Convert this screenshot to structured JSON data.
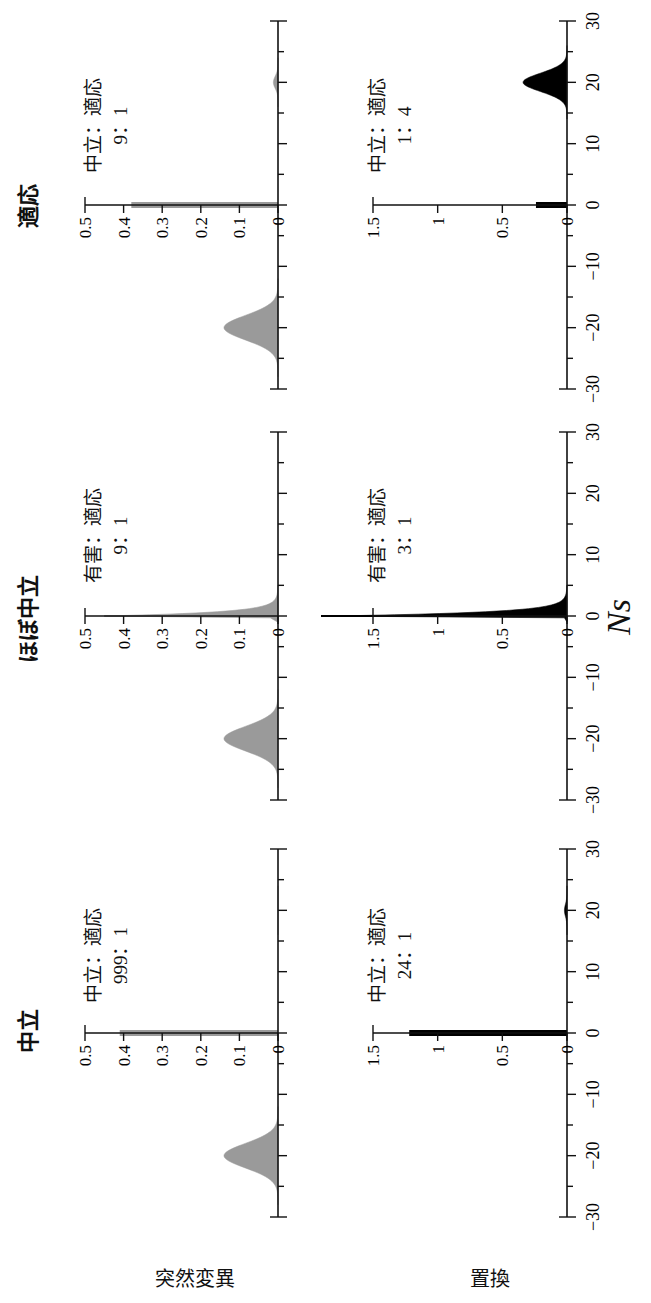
{
  "figure": {
    "orientation": "rotated 90 degrees counterclockwise",
    "x_axis_label": "Ns",
    "columns": [
      "中立",
      "ほぼ中立",
      "適応"
    ],
    "rows": [
      "突然変異",
      "置換"
    ],
    "x_ticks": [
      "−30",
      "−20",
      "−10",
      "0",
      "10",
      "20",
      "30"
    ],
    "row_y_ticks": {
      "突然変異": [
        "0",
        "0.1",
        "0.2",
        "0.3",
        "0.4",
        "0.5"
      ],
      "置換": [
        "0",
        "0.5",
        "1",
        "1.5"
      ]
    },
    "annotations": {
      "neutral_mut_1": "中立：適応",
      "neutral_mut_2": "999：1",
      "neutral_sub_1": "中立：適応",
      "neutral_sub_2": "24：1",
      "nearly_mut_1": "有害：適応",
      "nearly_mut_2": "9：1",
      "nearly_sub_1": "有害：適応",
      "nearly_sub_2": "3：1",
      "adaptive_mut_1": "中立：適応",
      "adaptive_mut_2": "9：1",
      "adaptive_sub_1": "中立：適応",
      "adaptive_sub_2": "1：4"
    }
  },
  "chart_data": [
    {
      "type": "area",
      "title": "中立 — 突然変異",
      "xlabel": "Ns",
      "ylabel": "突然変異",
      "xlim": [
        -30,
        30
      ],
      "ylim": [
        0,
        0.5
      ],
      "annotation": "中立：適応 999：1",
      "series": [
        {
          "name": "deleterious (Ns≈−20)",
          "shape": "gaussian",
          "center": -20,
          "sd": 2,
          "peak": 0.14
        },
        {
          "name": "neutral spike (Ns=0)",
          "shape": "spike",
          "x": 0,
          "value": 0.41
        },
        {
          "name": "adaptive (Ns≈20)",
          "shape": "gaussian",
          "center": 20,
          "sd": 1,
          "peak": 0.0
        }
      ],
      "color": "#9a9a9a"
    },
    {
      "type": "area",
      "title": "中立 — 置換",
      "xlabel": "Ns",
      "ylabel": "置換",
      "xlim": [
        -30,
        30
      ],
      "ylim": [
        0,
        1.5
      ],
      "annotation": "中立：適応 24：1",
      "series": [
        {
          "name": "neutral spike (Ns=0)",
          "shape": "spike",
          "x": 0,
          "value": 1.22
        },
        {
          "name": "adaptive (Ns≈20)",
          "shape": "gaussian",
          "center": 20,
          "sd": 1,
          "peak": 0.02
        }
      ],
      "color": "#000000"
    },
    {
      "type": "area",
      "title": "ほぼ中立 — 突然変異",
      "xlabel": "Ns",
      "ylabel": "突然変異",
      "xlim": [
        -30,
        30
      ],
      "ylim": [
        0,
        0.5
      ],
      "annotation": "有害：適応 9：1",
      "series": [
        {
          "name": "deleterious (Ns≈−20)",
          "shape": "gaussian",
          "center": -20,
          "sd": 2,
          "peak": 0.14
        },
        {
          "name": "nearly neutral (Ns≈0, exponential tail)",
          "shape": "exp-decay",
          "x": 0,
          "value": 0.45,
          "tail_to": 5
        }
      ],
      "color": "#9a9a9a"
    },
    {
      "type": "area",
      "title": "ほぼ中立 — 置換",
      "xlabel": "Ns",
      "ylabel": "置換",
      "xlim": [
        -30,
        30
      ],
      "ylim": [
        0,
        1.8
      ],
      "annotation": "有害：適応 3：1",
      "series": [
        {
          "name": "nearly neutral (Ns≈0, exponential tail)",
          "shape": "exp-decay",
          "x": 0,
          "value": 1.8,
          "tail_to": 5
        }
      ],
      "color": "#000000"
    },
    {
      "type": "area",
      "title": "適応 — 突然変異",
      "xlabel": "Ns",
      "ylabel": "突然変異",
      "xlim": [
        -30,
        30
      ],
      "ylim": [
        0,
        0.5
      ],
      "annotation": "中立：適応 9：1",
      "series": [
        {
          "name": "deleterious (Ns≈−20)",
          "shape": "gaussian",
          "center": -20,
          "sd": 2,
          "peak": 0.14
        },
        {
          "name": "neutral spike (Ns=0)",
          "shape": "spike",
          "x": 0,
          "value": 0.38
        },
        {
          "name": "adaptive (Ns≈20)",
          "shape": "gaussian",
          "center": 20,
          "sd": 1,
          "peak": 0.012
        }
      ],
      "color": "#9a9a9a"
    },
    {
      "type": "area",
      "title": "適応 — 置換",
      "xlabel": "Ns",
      "ylabel": "置換",
      "xlim": [
        -30,
        30
      ],
      "ylim": [
        0,
        1.5
      ],
      "annotation": "中立：適応 1：4",
      "series": [
        {
          "name": "neutral spike (Ns=0)",
          "shape": "spike",
          "x": 0,
          "value": 0.24
        },
        {
          "name": "adaptive (Ns≈20)",
          "shape": "gaussian",
          "center": 20,
          "sd": 1.5,
          "peak": 0.34
        }
      ],
      "color": "#000000"
    }
  ]
}
